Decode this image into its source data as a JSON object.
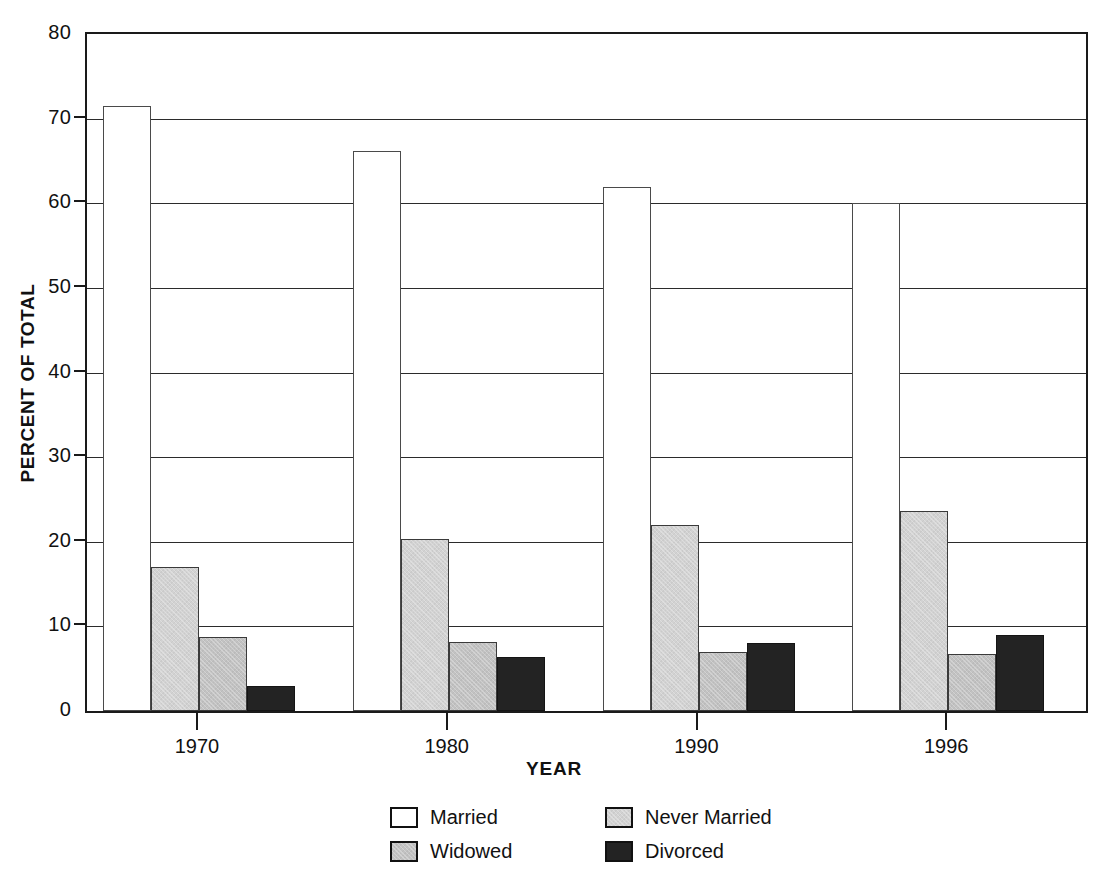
{
  "chart_data": {
    "type": "bar",
    "title": "",
    "subtitle": "",
    "xlabel": "YEAR",
    "ylabel": "PERCENT OF TOTAL",
    "categories": [
      "1970",
      "1980",
      "1990",
      "1996"
    ],
    "ylim": [
      0,
      80
    ],
    "yticks": [
      0,
      10,
      20,
      30,
      40,
      50,
      60,
      70,
      80
    ],
    "ytick_labels": [
      "0",
      "10",
      "20",
      "30",
      "40",
      "50",
      "60",
      "70",
      "80"
    ],
    "grid": true,
    "grid_axis": "y",
    "legend_position": "bottom",
    "legend_columns": 2,
    "series": [
      {
        "name": "Married",
        "color": "#ffffff",
        "values": [
          71.5,
          66.2,
          61.9,
          60.0
        ]
      },
      {
        "name": "Never Married",
        "color": "#d2d2d2",
        "values": [
          17.0,
          20.3,
          22.0,
          23.6
        ]
      },
      {
        "name": "Widowed",
        "color": "#c2c2c2",
        "values": [
          8.7,
          8.1,
          7.0,
          6.7
        ]
      },
      {
        "name": "Divorced",
        "color": "#232323",
        "values": [
          3.0,
          6.4,
          8.0,
          9.0
        ]
      }
    ],
    "legend_order": [
      "Married",
      "Never Married",
      "Widowed",
      "Divorced"
    ]
  },
  "axes": {
    "y_title": "PERCENT OF TOTAL",
    "x_title": "YEAR"
  },
  "colors": {
    "frame": "#1a1a1a",
    "gridline": "#2b2b2b",
    "text": "#111111",
    "married": "#ffffff",
    "never_married": "#d2d2d2",
    "widowed": "#c2c2c2",
    "divorced": "#232323"
  }
}
